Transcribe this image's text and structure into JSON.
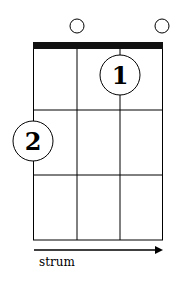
{
  "chord_diagram": {
    "strings": 4,
    "frets_shown": 3,
    "open_strings": [
      2,
      4
    ],
    "fingers": [
      {
        "number": "1",
        "string": 3,
        "fret": 1
      },
      {
        "number": "2",
        "string": 1,
        "fret": 2
      }
    ],
    "strum_label": "strum",
    "colors": {
      "line": "#000000",
      "background": "#ffffff"
    }
  }
}
